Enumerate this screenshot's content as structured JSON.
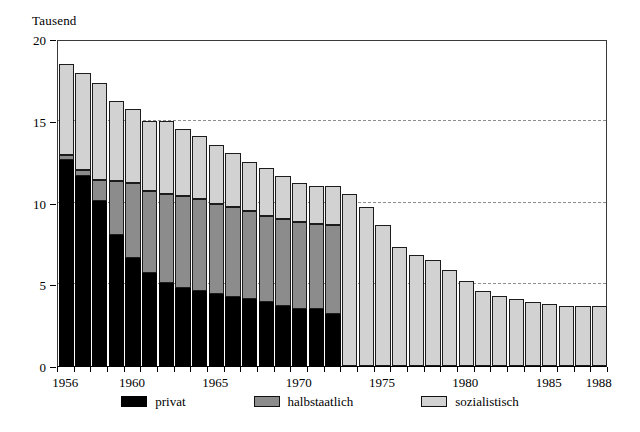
{
  "chart_data": {
    "type": "bar",
    "stacked": true,
    "title": "",
    "subtitle": "",
    "unit_caption": "Tausend",
    "xlabel": "",
    "ylabel": "",
    "ylim": [
      0,
      20
    ],
    "yticks": [
      0,
      5,
      10,
      15,
      20
    ],
    "ytick_labels": [
      "0",
      "5",
      "10",
      "15",
      "20"
    ],
    "grid": "horizontal-dashed",
    "legend_position": "bottom",
    "categories": [
      "1956",
      "1957",
      "1958",
      "1959",
      "1960",
      "1961",
      "1962",
      "1963",
      "1964",
      "1965",
      "1966",
      "1967",
      "1968",
      "1969",
      "1970",
      "1971",
      "1972",
      "1973",
      "1974",
      "1975",
      "1976",
      "1977",
      "1978",
      "1979",
      "1980",
      "1981",
      "1982",
      "1983",
      "1984",
      "1985",
      "1986",
      "1987",
      "1988"
    ],
    "xtick_labels": [
      "1956",
      "1960",
      "1965",
      "1970",
      "1975",
      "1980",
      "1985",
      "1988"
    ],
    "series": [
      {
        "name": "privat",
        "color": "#000000",
        "values": [
          12.6,
          11.6,
          10.1,
          8.0,
          6.6,
          5.7,
          5.1,
          4.8,
          4.6,
          4.4,
          4.2,
          4.1,
          3.9,
          3.7,
          3.5,
          3.5,
          3.2,
          0,
          0,
          0,
          0,
          0,
          0,
          0,
          0,
          0,
          0,
          0,
          0,
          0,
          0,
          0,
          0
        ]
      },
      {
        "name": "halbstaatlich",
        "color": "#8c8c8c",
        "values": [
          0.3,
          0.4,
          1.3,
          3.3,
          4.6,
          5.0,
          5.4,
          5.6,
          5.6,
          5.5,
          5.5,
          5.4,
          5.3,
          5.3,
          5.3,
          5.2,
          5.4,
          0,
          0,
          0,
          0,
          0,
          0,
          0,
          0,
          0,
          0,
          0,
          0,
          0,
          0,
          0,
          0
        ]
      },
      {
        "name": "sozialistisch",
        "color": "#d2d2d2",
        "values": [
          5.6,
          5.9,
          5.9,
          4.9,
          4.5,
          4.3,
          4.5,
          4.1,
          3.9,
          3.6,
          3.3,
          3.0,
          2.9,
          2.6,
          2.4,
          2.3,
          2.4,
          10.5,
          9.7,
          8.6,
          7.3,
          6.8,
          6.5,
          5.9,
          5.2,
          4.6,
          4.3,
          4.1,
          3.9,
          3.8,
          3.7,
          3.7,
          3.7
        ]
      }
    ],
    "totals": [
      18.5,
      17.9,
      17.3,
      16.2,
      15.7,
      15.0,
      15.0,
      14.5,
      14.1,
      13.5,
      13.0,
      12.5,
      12.1,
      11.6,
      11.2,
      11.0,
      11.0,
      10.5,
      9.7,
      8.6,
      7.3,
      6.8,
      6.5,
      5.9,
      5.2,
      4.6,
      4.3,
      4.1,
      3.9,
      3.8,
      3.7,
      3.7,
      3.7
    ]
  },
  "legend": {
    "items": [
      {
        "label": "privat",
        "swatch": "privat"
      },
      {
        "label": "halbstaatlich",
        "swatch": "halb"
      },
      {
        "label": "sozialistisch",
        "swatch": "sozi"
      }
    ]
  }
}
